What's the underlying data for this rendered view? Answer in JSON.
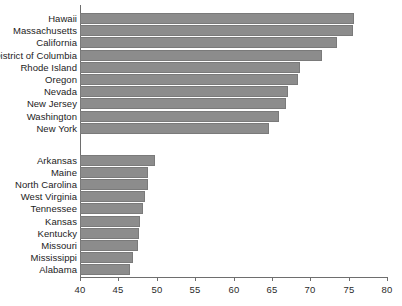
{
  "chart_data": {
    "type": "bar",
    "orientation": "horizontal",
    "title": "",
    "xlabel": "",
    "ylabel": "",
    "xlim": [
      40,
      80
    ],
    "xticks": [
      40,
      45,
      50,
      55,
      60,
      65,
      70,
      75,
      80
    ],
    "grid": false,
    "legend": null,
    "bar_color": "#8c8c8c",
    "bar_edge_color": "#7a7a7a",
    "axis_color": "#6e6e6e",
    "background": "#ffffff",
    "groups": [
      {
        "name": "highest",
        "categories": [
          "Hawaii",
          "Massachusetts",
          "California",
          "District of Columbia",
          "Rhode Island",
          "Oregon",
          "Nevada",
          "New Jersey",
          "Washington",
          "New York"
        ],
        "values": [
          75.7,
          75.6,
          73.5,
          71.5,
          68.6,
          68.4,
          67.1,
          66.8,
          65.9,
          64.6
        ]
      },
      {
        "name": "lowest",
        "categories": [
          "Arkansas",
          "Maine",
          "North Carolina",
          "West Virginia",
          "Tennessee",
          "Kansas",
          "Kentucky",
          "Missouri",
          "Mississippi",
          "Alabama"
        ],
        "values": [
          49.8,
          48.9,
          48.8,
          48.5,
          48.2,
          47.8,
          47.7,
          47.5,
          46.9,
          46.5
        ]
      }
    ]
  }
}
